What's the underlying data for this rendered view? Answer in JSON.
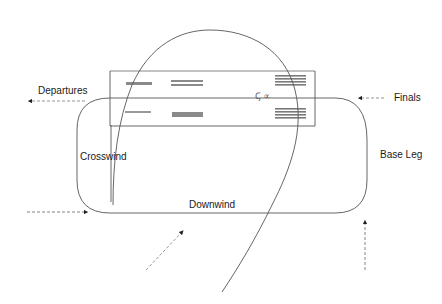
{
  "diagram": {
    "labels": {
      "departures": "Departures",
      "finals": "Finals",
      "crosswind": "Crosswind",
      "base_leg": "Base Leg",
      "downwind": "Downwind",
      "runway_marker": "Ꞔ ∝"
    },
    "colors": {
      "line": "#555555",
      "arrow": "#888888",
      "marking": "#9a9a9a",
      "background": "#ffffff",
      "text": "#1a1a1a"
    },
    "elements": {
      "runway": {
        "x": 110,
        "y": 70,
        "width": 205,
        "height": 56
      },
      "circuit": {
        "left": 75,
        "top": 98,
        "right": 367,
        "bottom": 213
      },
      "arrows": [
        {
          "name": "departures-arrow",
          "from": [
            85,
            101
          ],
          "to": [
            28,
            101
          ]
        },
        {
          "name": "finals-arrow",
          "from": [
            384,
            98
          ],
          "to": [
            358,
            98
          ]
        },
        {
          "name": "entry-arrow-left",
          "from": [
            27,
            212
          ],
          "to": [
            88,
            212
          ]
        },
        {
          "name": "entry-arrow-diagonal",
          "from": [
            146,
            270
          ],
          "to": [
            184,
            230
          ]
        },
        {
          "name": "entry-arrow-bottom-right",
          "from": [
            365,
            270
          ],
          "to": [
            365,
            220
          ]
        }
      ]
    }
  }
}
